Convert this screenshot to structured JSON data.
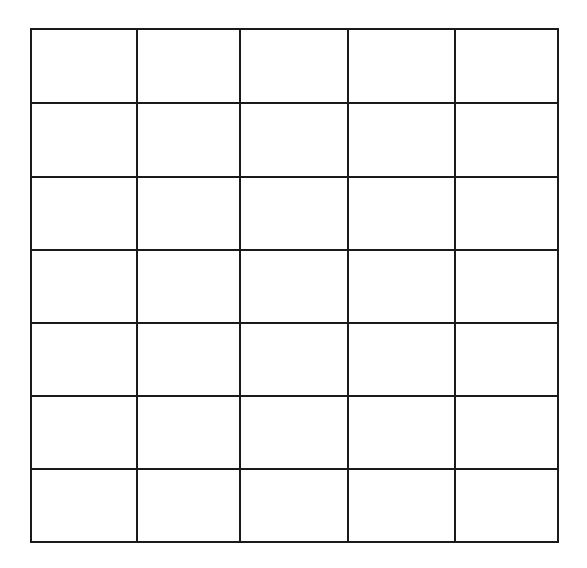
{
  "grid": {
    "rows": 7,
    "cols": 5,
    "line_color": "#1a1a1a",
    "background": "#ffffff",
    "row_lines_y": [
      29,
      103,
      177,
      250,
      323,
      396,
      469,
      542
    ],
    "col_lines_x": [
      31,
      137,
      240,
      348,
      455,
      558
    ],
    "cells": [
      [
        "",
        "",
        "",
        "",
        ""
      ],
      [
        "",
        "",
        "",
        "",
        ""
      ],
      [
        "",
        "",
        "",
        "",
        ""
      ],
      [
        "",
        "",
        "",
        "",
        ""
      ],
      [
        "",
        "",
        "",
        "",
        ""
      ],
      [
        "",
        "",
        "",
        "",
        ""
      ],
      [
        "",
        "",
        "",
        "",
        ""
      ]
    ]
  }
}
